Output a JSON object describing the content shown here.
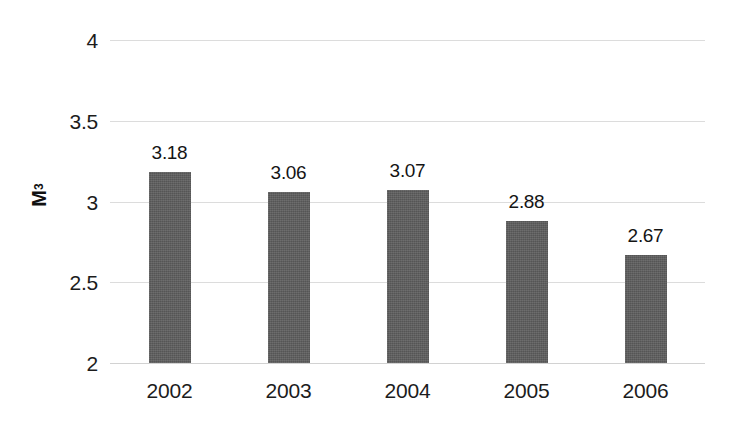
{
  "chart_data": {
    "type": "bar",
    "title": "",
    "subtitle": "",
    "xlabel": "",
    "ylabel": "M3",
    "ylabel_display": "M",
    "ylabel_superscript": "3",
    "categories": [
      "2002",
      "2003",
      "2004",
      "2005",
      "2006"
    ],
    "values": [
      3.18,
      3.06,
      3.07,
      2.88,
      2.67
    ],
    "value_labels": [
      "3.18",
      "3.06",
      "3.07",
      "2.88",
      "2.67"
    ],
    "ylim": [
      2,
      4
    ],
    "yticks": [
      2,
      2.5,
      3,
      3.5,
      4
    ],
    "ytick_labels": [
      "2",
      "2.5",
      "3",
      "3.5",
      "4"
    ],
    "grid": true,
    "grid_axis": "y",
    "legend": false,
    "legend_position": "none",
    "series": [
      {
        "name": "",
        "values": [
          3.18,
          3.06,
          3.07,
          2.88,
          2.67
        ]
      }
    ],
    "colors": {
      "bar_fill": "#5e5e5e",
      "gridline": "#dcdcdc",
      "text": "#1c1c1c",
      "background": "#ffffff"
    }
  }
}
